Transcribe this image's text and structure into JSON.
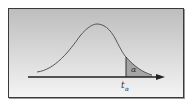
{
  "diagram": {
    "title": "",
    "curve": "t-distribution density curve",
    "shaded_region_label": "α",
    "critical_value_label": "t",
    "critical_value_subscript": "α",
    "colors": {
      "curve": "#555555",
      "axis": "#222222",
      "shade": "#8f8f8f",
      "frame_border": "#3a3a3a"
    }
  }
}
